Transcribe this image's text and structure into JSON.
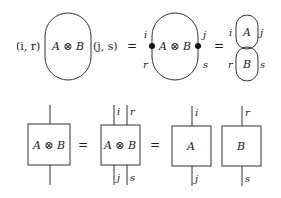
{
  "top_row": {
    "lhs": {
      "left_index": "(i, r)",
      "right_index": "(j, s)",
      "label": "A ⊗ B"
    },
    "eq1": "=",
    "middle": {
      "label": "A ⊗ B",
      "top_left": "i",
      "bottom_left": "r",
      "top_right": "j",
      "bottom_right": "s"
    },
    "eq2": "=",
    "rhs": {
      "top_label": "A",
      "bottom_label": "B",
      "top_left": "i",
      "top_right": "j",
      "bottom_left": "r",
      "bottom_right": "s"
    }
  },
  "bottom_row": {
    "box1": {
      "label": "A ⊗ B"
    },
    "eq1": "=",
    "box2": {
      "label": "A ⊗ B",
      "top_left": "i",
      "top_right": "r",
      "bottom_left": "j",
      "bottom_right": "s"
    },
    "eq2": "=",
    "boxA": {
      "label": "A",
      "top": "i",
      "bottom": "j"
    },
    "boxB": {
      "label": "B",
      "top": "r",
      "bottom": "s"
    }
  }
}
